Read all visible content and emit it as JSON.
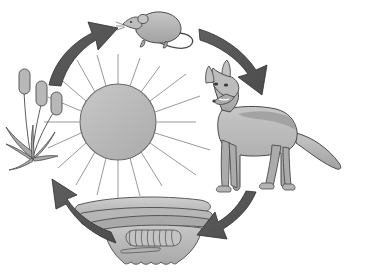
{
  "diagram": {
    "subtitle": "",
    "corner_mark": "",
    "background_color": "#ffffff",
    "direction": "clockwise",
    "palette": {
      "arrow_fill": "#565656",
      "arrow_stroke": "#2e2e2e",
      "sun_fill": "#b9b9b9",
      "sun_stroke": "#6a6a6a",
      "ray_stroke": "#8d8d8d",
      "organism_fill": "#b3b3b3",
      "organism_fill_light": "#c8c8c8",
      "organism_fill_dark": "#9a9a9a",
      "organism_stroke": "#4a4a4a",
      "soil_fill": "#bcbcbc",
      "soil_fill_light": "#d2d2d2",
      "soil_fill_dark": "#a4a4a4",
      "outline": "#3f3f3f"
    }
  },
  "center": {
    "name": "sun",
    "label": "Sun",
    "icon": "sun-icon",
    "ray_count": 20,
    "radius": 38,
    "cx": 118,
    "cy": 122
  },
  "nodes": [
    {
      "id": "producer",
      "label": "Cattail plants",
      "role": "Producer",
      "icon": "cattail-plant-icon",
      "position": "left"
    },
    {
      "id": "primary-consumer",
      "label": "Mouse",
      "role": "Primary consumer",
      "icon": "mouse-icon",
      "position": "top"
    },
    {
      "id": "secondary-consumer",
      "label": "Coyote",
      "role": "Secondary consumer",
      "icon": "coyote-icon",
      "position": "right"
    },
    {
      "id": "decomposers",
      "label": "Soil and decomposers",
      "role": "Decomposers",
      "icon": "soil-decomposer-icon",
      "position": "bottom"
    }
  ],
  "arrows": [
    {
      "id": "arrow-producer-to-mouse",
      "label": "Plants to mouse",
      "from": "producer",
      "to": "primary-consumer",
      "position": "top-left",
      "direction": "up-right"
    },
    {
      "id": "arrow-mouse-to-coyote",
      "label": "Mouse to coyote",
      "from": "primary-consumer",
      "to": "secondary-consumer",
      "position": "top-right",
      "direction": "down-right"
    },
    {
      "id": "arrow-coyote-to-soil",
      "label": "Coyote to soil",
      "from": "secondary-consumer",
      "to": "decomposers",
      "position": "bottom-right",
      "direction": "down-left"
    },
    {
      "id": "arrow-soil-to-producer",
      "label": "Soil to plants",
      "from": "decomposers",
      "to": "producer",
      "position": "bottom-left",
      "direction": "up-left"
    }
  ]
}
